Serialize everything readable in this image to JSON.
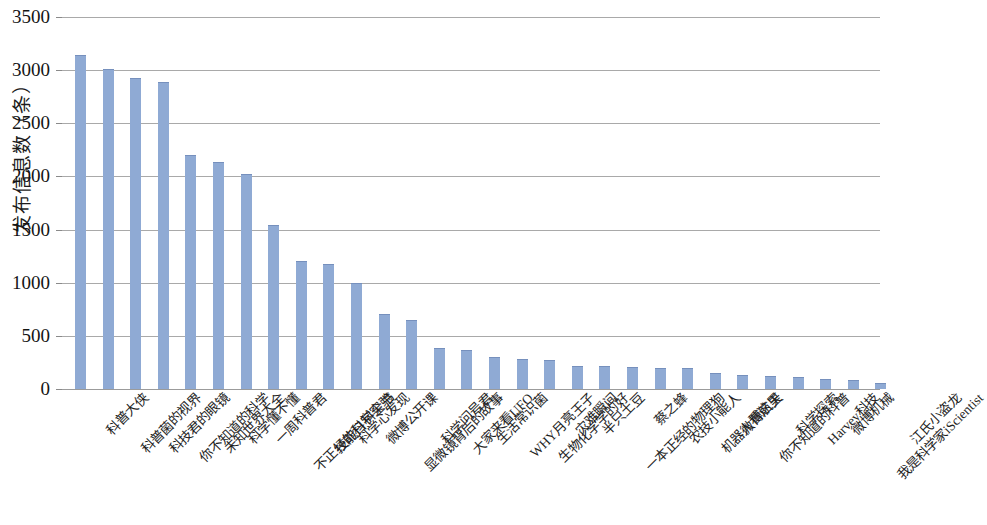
{
  "chart_data": {
    "type": "bar",
    "title": "",
    "subtitle": "",
    "xlabel": "",
    "ylabel": "发布信息数（条）",
    "ylim": [
      0,
      3500
    ],
    "ytick_values": [
      0,
      500,
      1000,
      1500,
      2000,
      2500,
      3000,
      3500
    ],
    "ytick_labels": [
      "0",
      "500",
      "1000",
      "1500",
      "2000",
      "2500",
      "3000",
      "3500"
    ],
    "grid": true,
    "legend": false,
    "legend_position": "none",
    "bar_color": "#8FAAD4",
    "gridline_color": "#9A9A9A",
    "categories": [
      "科普大侠",
      "科普菌的视界",
      "科技君的眼镜",
      "你不知道的科学",
      "未知世界大全",
      "科学懂不懂",
      "一周科普君",
      "不正经的科学实验",
      "技能日科全书",
      "科学心发现",
      "微博公开课",
      "显微镜背后的故事",
      "科学问号君",
      "大家来看UFO",
      "生活常识菌",
      "WHY月亮王子",
      "生物化学学的好",
      "灾难瞬间",
      "半只土豆",
      "一本正经的物理狗",
      "蔡之蜂",
      "农技小能人",
      "机器人看这里",
      "微博航天",
      "你不知道的科普",
      "科学探索",
      "Harvey科技",
      "微博机械",
      "我是科学家iScientist",
      "江氏小盗龙"
    ],
    "values": [
      3140,
      3010,
      2930,
      2890,
      2200,
      2140,
      2020,
      1540,
      1200,
      1180,
      1000,
      710,
      650,
      390,
      370,
      300,
      285,
      270,
      220,
      215,
      205,
      200,
      195,
      150,
      130,
      120,
      110,
      95,
      85,
      55
    ]
  }
}
